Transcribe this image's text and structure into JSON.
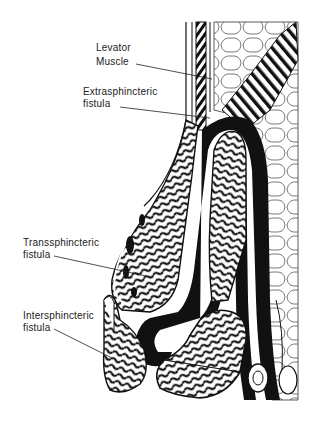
{
  "diagram": {
    "labels": [
      {
        "id": "levator",
        "lines": [
          "Levator",
          "Muscle"
        ]
      },
      {
        "id": "extrasphincteric",
        "lines": [
          "Extrasphincteric",
          "fistula"
        ]
      },
      {
        "id": "transsphincteric",
        "lines": [
          "Transsphincteric",
          "fistula"
        ]
      },
      {
        "id": "intersphincteric",
        "lines": [
          "Intersphincteric",
          "fistula"
        ]
      }
    ],
    "colors": {
      "ink": "#111111",
      "paper": "#ffffff",
      "label_text": "#222222"
    }
  }
}
